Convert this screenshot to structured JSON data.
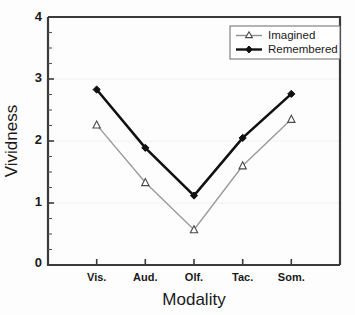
{
  "chart_data": {
    "type": "line",
    "title": "",
    "xlabel": "Modality",
    "ylabel": "Vividness",
    "categories": [
      "Vis.",
      "Aud.",
      "Olf.",
      "Tac.",
      "Som."
    ],
    "ylim": [
      0,
      4
    ],
    "xlim": [
      0,
      6
    ],
    "yticks": [
      0,
      1,
      2,
      3,
      4
    ],
    "ytick_labels": [
      "0",
      "1",
      "2",
      "3",
      "4"
    ],
    "yminor_step": 0.25,
    "grid": "faint horizontal gridlines at major y ticks",
    "legend_position": "top-right inside plot area",
    "series": [
      {
        "name": "Imagined",
        "values": [
          2.26,
          1.33,
          0.57,
          1.6,
          2.35
        ],
        "marker": "open-triangle",
        "color": "#9a9a9a",
        "marker_fill": "#ffffff",
        "marker_edge": "#4a4a4a",
        "line_width": 1.4
      },
      {
        "name": "Remembered",
        "values": [
          2.83,
          1.89,
          1.12,
          2.05,
          2.76
        ],
        "marker": "filled-diamond",
        "color": "#111111",
        "marker_fill": "#111111",
        "marker_edge": "#111111",
        "line_width": 2.6
      }
    ]
  },
  "axes": {
    "y_title": "Vividness",
    "x_title": "Modality",
    "y_tick_0": "0",
    "y_tick_1": "1",
    "y_tick_2": "2",
    "y_tick_3": "3",
    "y_tick_4": "4",
    "x_tick_0": "Vis.",
    "x_tick_1": "Aud.",
    "x_tick_2": "Olf.",
    "x_tick_3": "Tac.",
    "x_tick_4": "Som."
  },
  "legend": {
    "entry_0": "Imagined",
    "entry_1": "Remembered"
  },
  "colors": {
    "axis": "#3a3a3a",
    "remembered": "#111111",
    "imagined": "#9a9a9a",
    "grid": "#f0f0f0",
    "background": "#fdfdfd"
  }
}
